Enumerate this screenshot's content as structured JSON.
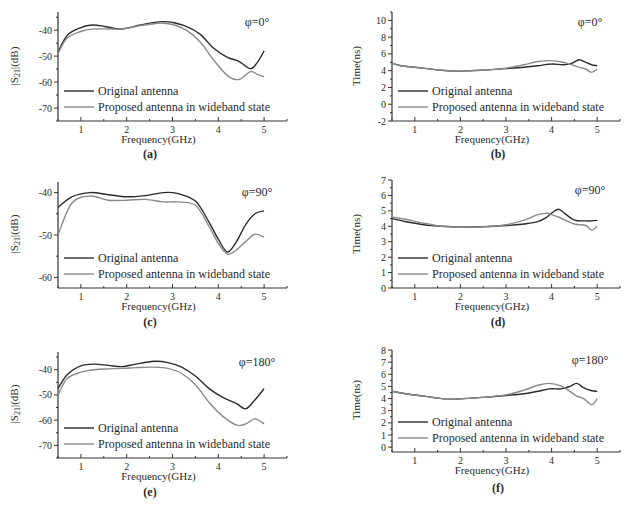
{
  "figure": {
    "legend": {
      "series1": "Original antenna",
      "series2": "Proposed antenna in wideband state"
    },
    "colors": {
      "original": "#2b2b2b",
      "proposed": "#8a8a8a"
    },
    "xlabel": "Frequency(GHz)"
  },
  "chart_data": [
    {
      "id": "a",
      "caption": "(a)",
      "type": "line",
      "annotation": "φ=0°",
      "title": "",
      "xlabel": "Frequency(GHz)",
      "ylabel": "|S21|(dB)",
      "xlim": [
        0.5,
        5.5
      ],
      "ylim": [
        -75,
        -33
      ],
      "xticks": [
        1,
        2,
        3,
        4,
        5
      ],
      "yticks": [
        -40,
        -50,
        -60,
        -70
      ],
      "legend_position": "lower-left",
      "grid": false,
      "x": [
        0.5,
        0.7,
        1.0,
        1.25,
        1.5,
        1.8,
        2.0,
        2.3,
        2.6,
        2.8,
        3.0,
        3.3,
        3.6,
        3.9,
        4.2,
        4.45,
        4.7,
        4.85,
        5.0
      ],
      "series": [
        {
          "name": "Original antenna",
          "values": [
            -48.5,
            -42,
            -39,
            -38,
            -38.5,
            -39.5,
            -39.2,
            -38,
            -37,
            -36.7,
            -37,
            -38.5,
            -41.5,
            -47,
            -50.5,
            -52,
            -54.8,
            -52.5,
            -48
          ]
        },
        {
          "name": "Proposed antenna in wideband state",
          "values": [
            -49,
            -43,
            -40.5,
            -39.6,
            -39.5,
            -39.6,
            -39.3,
            -38.2,
            -37.5,
            -37.3,
            -37.8,
            -40,
            -44.5,
            -51.5,
            -57.5,
            -59,
            -56,
            -57,
            -58
          ]
        }
      ]
    },
    {
      "id": "b",
      "caption": "(b)",
      "type": "line",
      "annotation": "φ=0°",
      "title": "",
      "xlabel": "Frequency(GHz)",
      "ylabel": "Time(ns)",
      "xlim": [
        0.5,
        5.5
      ],
      "ylim": [
        -2,
        11
      ],
      "xticks": [
        1,
        2,
        3,
        4,
        5
      ],
      "yticks": [
        10,
        8,
        6,
        4,
        2,
        0,
        -2
      ],
      "legend_position": "lower-left",
      "grid": false,
      "x": [
        0.5,
        0.7,
        1.0,
        1.5,
        1.85,
        2.2,
        2.6,
        3.0,
        3.4,
        3.7,
        4.0,
        4.25,
        4.45,
        4.6,
        4.75,
        4.88,
        5.0
      ],
      "series": [
        {
          "name": "Original antenna",
          "values": [
            4.9,
            4.6,
            4.4,
            4.1,
            3.95,
            4.0,
            4.1,
            4.25,
            4.4,
            4.6,
            4.8,
            4.7,
            4.9,
            5.3,
            5.0,
            4.7,
            4.6
          ]
        },
        {
          "name": "Proposed antenna in wideband state",
          "values": [
            4.9,
            4.6,
            4.4,
            4.1,
            3.95,
            4.0,
            4.1,
            4.3,
            4.7,
            5.1,
            5.2,
            5.0,
            4.7,
            4.4,
            4.2,
            3.8,
            4.2
          ]
        }
      ]
    },
    {
      "id": "c",
      "caption": "(c)",
      "type": "line",
      "annotation": "φ=90°",
      "title": "",
      "xlabel": "Frequency(GHz)",
      "ylabel": "|S21|(dB)",
      "xlim": [
        0.5,
        5.5
      ],
      "ylim": [
        -62.5,
        -37.5
      ],
      "xticks": [
        1,
        2,
        3,
        4,
        5
      ],
      "yticks": [
        -40,
        -50,
        -60
      ],
      "legend_position": "lower-left",
      "grid": false,
      "x": [
        0.5,
        0.8,
        1.2,
        1.6,
        2.0,
        2.4,
        2.8,
        3.1,
        3.5,
        3.8,
        4.0,
        4.2,
        4.4,
        4.6,
        4.8,
        5.0
      ],
      "series": [
        {
          "name": "Original antenna",
          "values": [
            -43.5,
            -41,
            -40,
            -40.5,
            -41,
            -40.7,
            -40,
            -40.2,
            -42,
            -47,
            -51,
            -54,
            -51.5,
            -47.5,
            -45,
            -44.3
          ]
        },
        {
          "name": "Proposed antenna in wideband state",
          "values": [
            -50,
            -42.5,
            -40.8,
            -41.8,
            -41.8,
            -41.6,
            -42.2,
            -42.2,
            -43,
            -48,
            -52,
            -54.5,
            -53.5,
            -51.5,
            -49.8,
            -50.5
          ]
        }
      ]
    },
    {
      "id": "d",
      "caption": "(d)",
      "type": "line",
      "annotation": "φ=90°",
      "title": "",
      "xlabel": "Frequency(GHz)",
      "ylabel": "Time(ns)",
      "xlim": [
        0.5,
        5.5
      ],
      "ylim": [
        0,
        7
      ],
      "xticks": [
        1,
        2,
        3,
        4,
        5
      ],
      "yticks": [
        7,
        6,
        5,
        4,
        3,
        2,
        1,
        0
      ],
      "legend_position": "lower-left",
      "grid": false,
      "x": [
        0.5,
        0.8,
        1.2,
        1.6,
        2.0,
        2.5,
        3.0,
        3.4,
        3.7,
        3.9,
        4.0,
        4.15,
        4.3,
        4.5,
        4.75,
        4.88,
        5.0
      ],
      "series": [
        {
          "name": "Original antenna",
          "values": [
            4.5,
            4.3,
            4.1,
            4.0,
            3.95,
            3.97,
            4.05,
            4.15,
            4.3,
            4.6,
            4.85,
            5.1,
            4.8,
            4.4,
            4.35,
            4.35,
            4.38
          ]
        },
        {
          "name": "Proposed antenna in wideband state",
          "values": [
            4.6,
            4.45,
            4.2,
            4.0,
            3.95,
            3.97,
            4.1,
            4.4,
            4.75,
            4.85,
            4.75,
            4.6,
            4.4,
            4.15,
            4.05,
            3.75,
            4.0
          ]
        }
      ]
    },
    {
      "id": "e",
      "caption": "(e)",
      "type": "line",
      "annotation": "φ=180°",
      "title": "",
      "xlabel": "Frequency(GHz)",
      "ylabel": "|S21|(dB)",
      "xlim": [
        0.5,
        5.5
      ],
      "ylim": [
        -75,
        -33
      ],
      "xticks": [
        1,
        2,
        3,
        4,
        5
      ],
      "yticks": [
        -40,
        -50,
        -60,
        -70
      ],
      "legend_position": "lower-left",
      "grid": false,
      "x": [
        0.5,
        0.7,
        1.0,
        1.3,
        1.6,
        1.9,
        2.2,
        2.6,
        2.9,
        3.2,
        3.5,
        3.8,
        4.1,
        4.4,
        4.6,
        4.8,
        5.0
      ],
      "series": [
        {
          "name": "Original antenna",
          "values": [
            -47.5,
            -42,
            -38.5,
            -37.8,
            -38.3,
            -38.8,
            -37.8,
            -36.7,
            -37.2,
            -39,
            -42.5,
            -47.5,
            -51,
            -53.5,
            -55.5,
            -52,
            -47.5
          ]
        },
        {
          "name": "Proposed antenna in wideband state",
          "values": [
            -50,
            -43.5,
            -41,
            -40,
            -39.7,
            -39.5,
            -39.2,
            -39,
            -39.5,
            -41.5,
            -46,
            -53,
            -58.5,
            -62,
            -61.5,
            -59.5,
            -61.5
          ]
        }
      ]
    },
    {
      "id": "f",
      "caption": "(f)",
      "type": "line",
      "annotation": "φ=180°",
      "title": "",
      "xlabel": "Frequency(GHz)",
      "ylabel": "Time(ns)",
      "xlim": [
        0.5,
        5.5
      ],
      "ylim": [
        -0.4,
        8
      ],
      "xticks": [
        1,
        2,
        3,
        4,
        5
      ],
      "yticks": [
        8,
        7,
        6,
        5,
        4,
        3,
        2,
        1,
        0
      ],
      "legend_position": "lower-left",
      "grid": false,
      "x": [
        0.5,
        0.8,
        1.2,
        1.7,
        2.0,
        2.5,
        3.0,
        3.4,
        3.7,
        3.95,
        4.2,
        4.4,
        4.55,
        4.7,
        4.88,
        5.0
      ],
      "series": [
        {
          "name": "Original antenna",
          "values": [
            4.6,
            4.4,
            4.2,
            3.95,
            3.98,
            4.1,
            4.25,
            4.4,
            4.6,
            4.8,
            4.8,
            5.0,
            5.25,
            4.9,
            4.65,
            4.6
          ]
        },
        {
          "name": "Proposed antenna in wideband state",
          "values": [
            4.6,
            4.4,
            4.2,
            3.95,
            3.98,
            4.1,
            4.3,
            4.7,
            5.1,
            5.25,
            5.05,
            4.6,
            4.2,
            4.0,
            3.5,
            4.0
          ]
        }
      ]
    }
  ]
}
